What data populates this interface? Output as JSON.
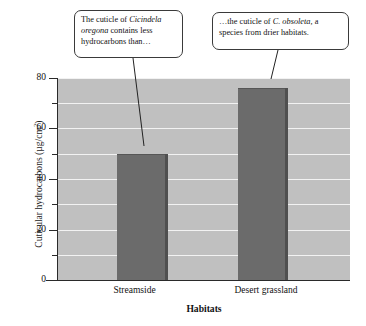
{
  "chart_data": {
    "type": "bar",
    "title": "",
    "categories": [
      "Streamside",
      "Desert grassland"
    ],
    "values": [
      50,
      76
    ],
    "xlabel": "Habitats",
    "ylabel": "Cuticular hydrocarbons (µg/cm2)",
    "ylim": [
      0,
      80
    ],
    "ytick_labels": [
      "0",
      "20",
      "40",
      "60",
      "80"
    ],
    "ytick_values": [
      0,
      20,
      40,
      60,
      80
    ],
    "yminor_values": [
      10,
      30,
      50,
      70
    ],
    "grid": true,
    "grid_interval": 10,
    "legend": "none",
    "bar_color": "#6b6b6b",
    "plot_background": "#c0c0c0",
    "gridline_color": "#f2f2f2"
  },
  "axes": {
    "ylabel_main": "Cuticular hydrocarbons (µg/cm",
    "ylabel_sup": "2",
    "ylabel_tail": ")",
    "xlabel": "Habitats"
  },
  "annotations": {
    "left": {
      "part1": "The cuticle of ",
      "species": "Cicindela oregona",
      "part2": " contains less hydrocarbons than…"
    },
    "right": {
      "part1": "…the cuticle of ",
      "species": "C. obsoleta,",
      "part2": " a species from drier habitats."
    }
  }
}
